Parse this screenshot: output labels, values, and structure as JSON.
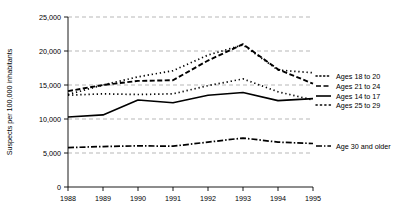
{
  "chart_data": {
    "type": "line",
    "title": "",
    "xlabel": "",
    "ylabel": "Suspects per 100,000 inhabitants",
    "x": [
      "1988",
      "1989",
      "1990",
      "1991",
      "1992",
      "1993",
      "1994",
      "1995"
    ],
    "xlim": [
      "1988",
      "1995"
    ],
    "ylim": [
      0,
      25000
    ],
    "yticks": [
      0,
      5000,
      10000,
      15000,
      20000,
      25000
    ],
    "ytick_labels": [
      "0",
      "5,000",
      "10,000",
      "15,000",
      "20,000",
      "25,000"
    ],
    "grid": "horizontal-dashed",
    "legend_position": "right",
    "series": [
      {
        "name": "Ages 18 to 20",
        "style": "dotted",
        "values": [
          13600,
          15000,
          16200,
          17100,
          19400,
          20900,
          17200,
          16800
        ]
      },
      {
        "name": "Ages 21 to 24",
        "style": "dashed",
        "values": [
          14100,
          15000,
          15600,
          15700,
          18600,
          21000,
          17300,
          15200
        ]
      },
      {
        "name": "Ages 14 to 17",
        "style": "solid",
        "values": [
          10300,
          10600,
          12800,
          12400,
          13500,
          13900,
          12700,
          13000
        ]
      },
      {
        "name": "Ages 25 to 29",
        "style": "dotted",
        "values": [
          13500,
          13700,
          13600,
          13700,
          14900,
          15900,
          14000,
          12800
        ]
      },
      {
        "name": "Age 30 and older",
        "style": "dash-dot",
        "values": [
          5800,
          5950,
          6050,
          6000,
          6600,
          7200,
          6600,
          6400
        ]
      }
    ]
  },
  "axis": {
    "y_title": "Suspects per 100,000 inhabitants",
    "y_tick_0": "0",
    "y_tick_1": "5,000",
    "y_tick_2": "10,000",
    "y_tick_3": "15,000",
    "y_tick_4": "20,000",
    "y_tick_5": "25,000",
    "x_tick_0": "1988",
    "x_tick_1": "1989",
    "x_tick_2": "1990",
    "x_tick_3": "1991",
    "x_tick_4": "1992",
    "x_tick_5": "1993",
    "x_tick_6": "1994",
    "x_tick_7": "1995"
  },
  "legend": {
    "items": [
      {
        "label": "Ages 18 to 20"
      },
      {
        "label": "Ages 21 to 24"
      },
      {
        "label": "Ages 14 to 17"
      },
      {
        "label": "Ages 25 to 29"
      },
      {
        "label": "Age 30 and older"
      }
    ]
  },
  "colors": {
    "ink": "#000000",
    "grid": "#9a9a9a",
    "background": "#ffffff"
  }
}
